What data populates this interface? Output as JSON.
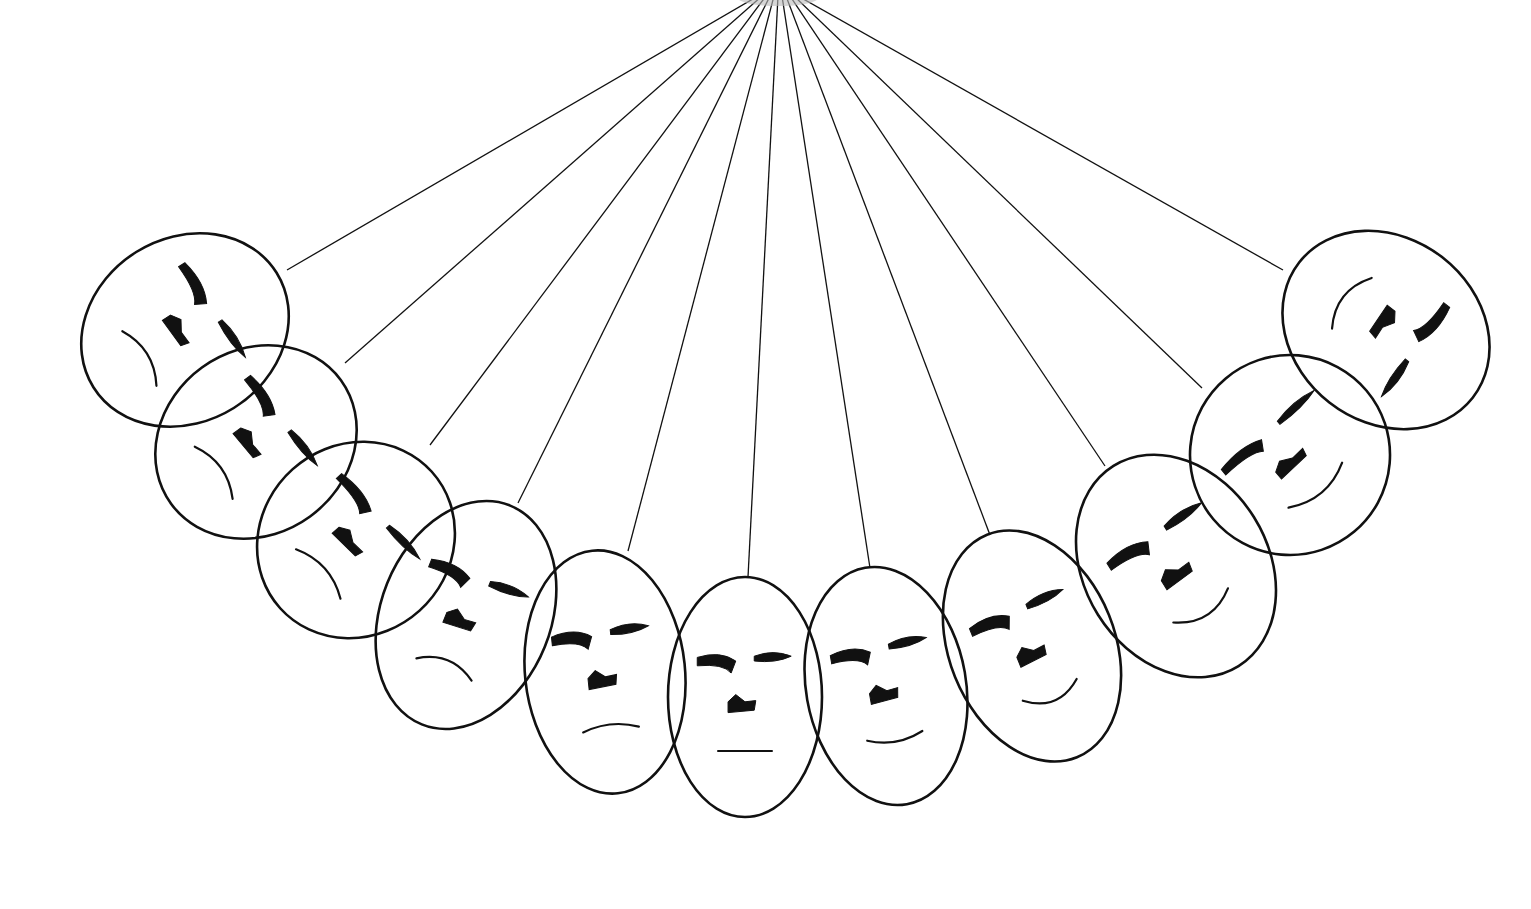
{
  "illustration": {
    "title": "Pendulum of faces",
    "background": "#ffffff",
    "ink_color": "#111111",
    "pivot": {
      "x": 778,
      "y": -4
    },
    "faces": [
      {
        "id": 1,
        "cx": 185,
        "cy": 330,
        "rx": 108,
        "ry": 92,
        "rotate": -32,
        "attach": [
          287,
          270
        ],
        "mood": "frown"
      },
      {
        "id": 2,
        "cx": 256,
        "cy": 442,
        "rx": 105,
        "ry": 92,
        "rotate": -36,
        "attach": [
          345,
          363
        ],
        "mood": "frown"
      },
      {
        "id": 3,
        "cx": 356,
        "cy": 540,
        "rx": 102,
        "ry": 95,
        "rotate": -42,
        "attach": [
          430,
          445
        ],
        "mood": "frown"
      },
      {
        "id": 4,
        "cx": 466,
        "cy": 615,
        "rx": 85,
        "ry": 118,
        "rotate": 22,
        "attach": [
          518,
          503
        ],
        "mood": "frown"
      },
      {
        "id": 5,
        "cx": 605,
        "cy": 672,
        "rx": 80,
        "ry": 122,
        "rotate": -6,
        "attach": [
          628,
          551
        ],
        "mood": "slight-frown"
      },
      {
        "id": 6,
        "cx": 745,
        "cy": 697,
        "rx": 77,
        "ry": 120,
        "rotate": 0,
        "attach": [
          748,
          577
        ],
        "mood": "neutral"
      },
      {
        "id": 7,
        "cx": 886,
        "cy": 686,
        "rx": 80,
        "ry": 120,
        "rotate": -10,
        "attach": [
          870,
          568
        ],
        "mood": "slight-smile"
      },
      {
        "id": 8,
        "cx": 1032,
        "cy": 646,
        "rx": 83,
        "ry": 120,
        "rotate": -22,
        "attach": [
          990,
          535
        ],
        "mood": "smile"
      },
      {
        "id": 9,
        "cx": 1176,
        "cy": 566,
        "rx": 92,
        "ry": 118,
        "rotate": -32,
        "attach": [
          1105,
          466
        ],
        "mood": "smile"
      },
      {
        "id": 10,
        "cx": 1290,
        "cy": 455,
        "rx": 100,
        "ry": 100,
        "rotate": -40,
        "attach": [
          1202,
          388
        ],
        "mood": "smile"
      },
      {
        "id": 11,
        "cx": 1386,
        "cy": 330,
        "rx": 110,
        "ry": 92,
        "rotate": 38,
        "attach": [
          1283,
          270
        ],
        "mood": "smile"
      }
    ]
  }
}
